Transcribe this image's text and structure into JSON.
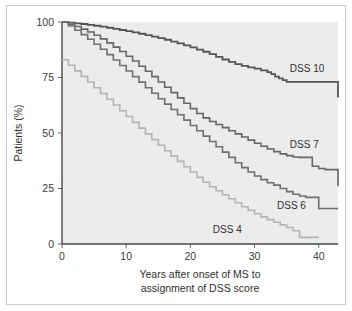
{
  "chart_data": {
    "type": "line",
    "title": "",
    "subtitle": "",
    "xlabel_line1": "Years after onset of MS to",
    "xlabel_line2": "assignment of DSS score",
    "ylabel": "Patients (%)",
    "xlim": [
      0,
      43
    ],
    "ylim": [
      0,
      100
    ],
    "xticks": [
      0,
      10,
      20,
      30,
      40
    ],
    "xtick_labels": [
      "0",
      "10",
      "20",
      "30",
      "40"
    ],
    "yticks": [
      0,
      25,
      50,
      75,
      100
    ],
    "ytick_labels": [
      "0",
      "25",
      "50",
      "75",
      "100"
    ],
    "grid": false,
    "legend_position": "inline-right-of-curve",
    "plot_background": "#ececec",
    "step_style": "post",
    "series": [
      {
        "name": "DSS 10",
        "label": "DSS 10",
        "color": "#555555",
        "line_width": 1.8,
        "label_x": 35.5,
        "label_y": 79,
        "x": [
          0,
          1,
          2,
          3,
          4,
          5,
          6,
          7,
          8,
          9,
          10,
          11,
          12,
          13,
          14,
          15,
          16,
          17,
          18,
          19,
          20,
          21,
          22,
          23,
          24,
          25,
          26,
          27,
          28,
          29,
          30,
          31,
          32,
          32.6,
          33.2,
          33.8,
          34.4,
          35,
          42.4,
          43
        ],
        "y": [
          100,
          99.7,
          99.4,
          99.1,
          98.7,
          98.3,
          97.9,
          97.4,
          96.9,
          96.4,
          95.9,
          95.3,
          94.7,
          94.1,
          93.4,
          92.7,
          92,
          91.2,
          90.4,
          89.5,
          88.6,
          87.6,
          86.6,
          85.5,
          84.3,
          83.1,
          82,
          81,
          80.2,
          79.6,
          79,
          78.2,
          77.4,
          76.5,
          75.4,
          74.6,
          73.8,
          73,
          73,
          66
        ]
      },
      {
        "name": "DSS 7",
        "label": "DSS 7",
        "color": "#666666",
        "line_width": 1.6,
        "label_x": 35.5,
        "label_y": 45,
        "x": [
          0,
          1,
          2,
          3,
          4,
          5,
          6,
          7,
          8,
          9,
          10,
          11,
          12,
          13,
          14,
          15,
          16,
          17,
          18,
          19,
          20,
          21,
          22,
          23,
          24,
          25,
          26,
          27,
          28,
          29,
          30,
          31,
          32,
          33,
          34,
          35,
          36,
          37,
          38,
          39,
          40,
          41,
          42,
          43
        ],
        "y": [
          100,
          99,
          98,
          96.8,
          95.5,
          94,
          92.4,
          90.6,
          88.7,
          86.7,
          84.6,
          82.4,
          80.1,
          77.8,
          75.4,
          73,
          70.6,
          68.2,
          65.8,
          63.4,
          61,
          58.8,
          56.8,
          55.2,
          53.8,
          52.4,
          51,
          49.6,
          48.2,
          46.8,
          45.4,
          44,
          42.8,
          41.6,
          40.6,
          39.8,
          39.2,
          39,
          39,
          35,
          34,
          33.5,
          33.5,
          26
        ]
      },
      {
        "name": "DSS 6",
        "label": "DSS 6",
        "color": "#6f6f6f",
        "line_width": 1.6,
        "label_x": 33.5,
        "label_y": 17.5,
        "x": [
          0,
          1,
          2,
          3,
          4,
          5,
          6,
          7,
          8,
          9,
          10,
          11,
          12,
          13,
          14,
          15,
          16,
          17,
          18,
          19,
          20,
          21,
          22,
          23,
          24,
          25,
          26,
          27,
          28,
          29,
          30,
          31,
          32,
          33,
          34,
          35,
          36,
          37,
          38,
          39,
          40,
          41,
          43
        ],
        "y": [
          100,
          98.2,
          96.3,
          94.3,
          92.2,
          90,
          87.7,
          85.3,
          82.9,
          80.4,
          77.9,
          75.4,
          72.9,
          70.4,
          67.9,
          65.4,
          63,
          60.6,
          58.2,
          55.8,
          53.4,
          51,
          48.6,
          46.2,
          43.8,
          41.4,
          39,
          36.6,
          34.4,
          32.4,
          30.6,
          29,
          27.6,
          26.5,
          25,
          23.6,
          22.4,
          21.6,
          21,
          21,
          16,
          16,
          16
        ]
      },
      {
        "name": "DSS 4",
        "label": "DSS 4",
        "color": "#b4b4b4",
        "line_width": 1.6,
        "label_x": 23.5,
        "label_y": 6.5,
        "x": [
          0,
          1,
          2,
          3,
          4,
          5,
          6,
          7,
          8,
          9,
          10,
          11,
          12,
          13,
          14,
          15,
          16,
          17,
          18,
          19,
          20,
          21,
          22,
          23,
          24,
          25,
          26,
          27,
          28,
          29,
          30,
          31,
          32,
          33,
          34,
          35,
          36,
          37,
          40
        ],
        "y": [
          83,
          80.5,
          78,
          75.5,
          73,
          70.4,
          67.8,
          65.2,
          62.6,
          60,
          57.4,
          54.8,
          52.2,
          49.6,
          47,
          44.5,
          42,
          39.6,
          37.2,
          34.8,
          32.4,
          30,
          27.8,
          25.8,
          24,
          22.2,
          20.4,
          18.6,
          16.8,
          15.2,
          13.6,
          12.2,
          11,
          9.8,
          8.6,
          7.4,
          6,
          3,
          3
        ]
      }
    ]
  },
  "axes": {
    "y_axis_title": "Patients (%)",
    "x_axis_title_line1": "Years after onset of MS to",
    "x_axis_title_line2": "assignment of DSS score"
  }
}
